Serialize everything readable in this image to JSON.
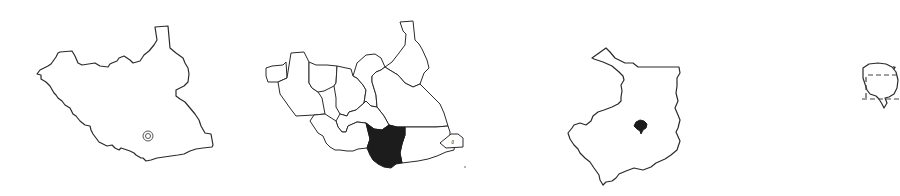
{
  "figure": {
    "panels": [
      {
        "id": "country-outline",
        "description": "South Sudan national outline with a location marker",
        "marker": {
          "type": "double-circle",
          "color": "#555555"
        }
      },
      {
        "id": "country-states",
        "description": "South Sudan divided into states, one state highlighted",
        "highlight_color": "#1c1c1c"
      },
      {
        "id": "state-detail",
        "description": "Highlighted state outline with a filled sub-area",
        "highlight_color": "#1c1c1c"
      },
      {
        "id": "local-inset",
        "description": "Partially cropped local inset with dashed boundary lines"
      }
    ],
    "colors": {
      "background": "#ffffff",
      "stroke": "#2a2a2a",
      "fill_highlight": "#1c1c1c"
    }
  }
}
